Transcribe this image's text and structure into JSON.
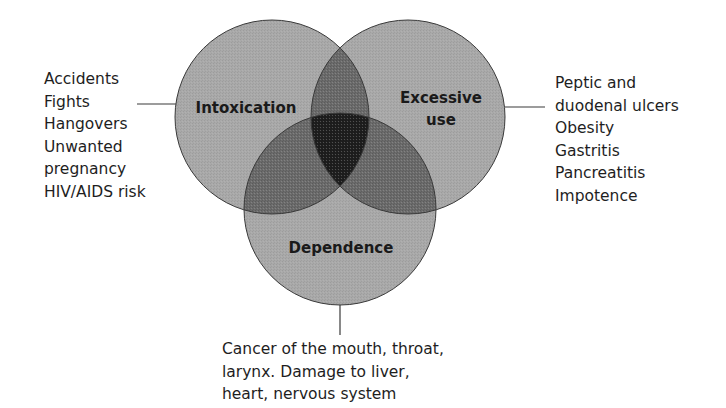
{
  "diagram": {
    "type": "venn",
    "colors": {
      "single": "#a9a9a9",
      "double": "#6b6b6b",
      "triple": "#1f1f1f",
      "outline": "#3a3a3a",
      "text": "#1e1e1e"
    },
    "circles": {
      "intoxication": {
        "label": "Intoxication",
        "outcomes": [
          "Accidents",
          "Fights",
          "Hangovers",
          "Unwanted",
          "pregnancy",
          "HIV/AIDS risk"
        ]
      },
      "excessive_use": {
        "label_line1": "Excessive",
        "label_line2": "use",
        "outcomes": [
          "Peptic and",
          "duodenal ulcers",
          "Obesity",
          "Gastritis",
          "Pancreatitis",
          "Impotence"
        ]
      },
      "dependence": {
        "label": "Dependence",
        "outcomes": [
          "Cancer of the mouth, throat,",
          "larynx. Damage to liver,",
          "heart, nervous system"
        ]
      }
    }
  }
}
